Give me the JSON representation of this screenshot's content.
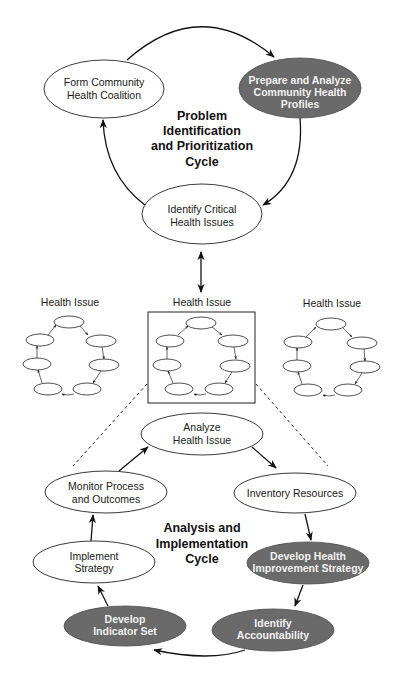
{
  "problem_cycle": {
    "title_lines": [
      "Problem",
      "Identification",
      "and Prioritization",
      "Cycle"
    ],
    "nodes": [
      {
        "id": "form-coalition",
        "lines": [
          "Form Community",
          "Health Coalition"
        ],
        "style": "light"
      },
      {
        "id": "prepare-profiles",
        "lines": [
          "Prepare and Analyze",
          "Community Health",
          "Profiles"
        ],
        "style": "dark"
      },
      {
        "id": "identify-issues",
        "lines": [
          "Identify Critical",
          "Health Issues"
        ],
        "style": "light"
      }
    ]
  },
  "health_issues": {
    "labels": [
      "Health Issue",
      "Health Issue",
      "Health Issue"
    ],
    "highlighted_index": 1
  },
  "analysis_cycle": {
    "title_lines": [
      "Analysis and",
      "Implementation",
      "Cycle"
    ],
    "nodes": [
      {
        "id": "analyze-issue",
        "lines": [
          "Analyze",
          "Health Issue"
        ],
        "style": "light"
      },
      {
        "id": "inventory-resources",
        "lines": [
          "Inventory Resources"
        ],
        "style": "light"
      },
      {
        "id": "develop-strategy",
        "lines": [
          "Develop Health",
          "Improvement Strategy"
        ],
        "style": "dark"
      },
      {
        "id": "identify-accountability",
        "lines": [
          "Identify",
          "Accountability"
        ],
        "style": "dark"
      },
      {
        "id": "develop-indicators",
        "lines": [
          "Develop",
          "Indicator Set"
        ],
        "style": "dark"
      },
      {
        "id": "implement-strategy",
        "lines": [
          "Implement",
          "Strategy"
        ],
        "style": "light"
      },
      {
        "id": "monitor-process",
        "lines": [
          "Monitor Process",
          "and Outcomes"
        ],
        "style": "light"
      }
    ]
  },
  "colors": {
    "dark_node_fill": "#6a6a6a",
    "dark_node_text": "#f2f2f2",
    "light_node_fill": "#ffffff",
    "line": "#111111"
  }
}
